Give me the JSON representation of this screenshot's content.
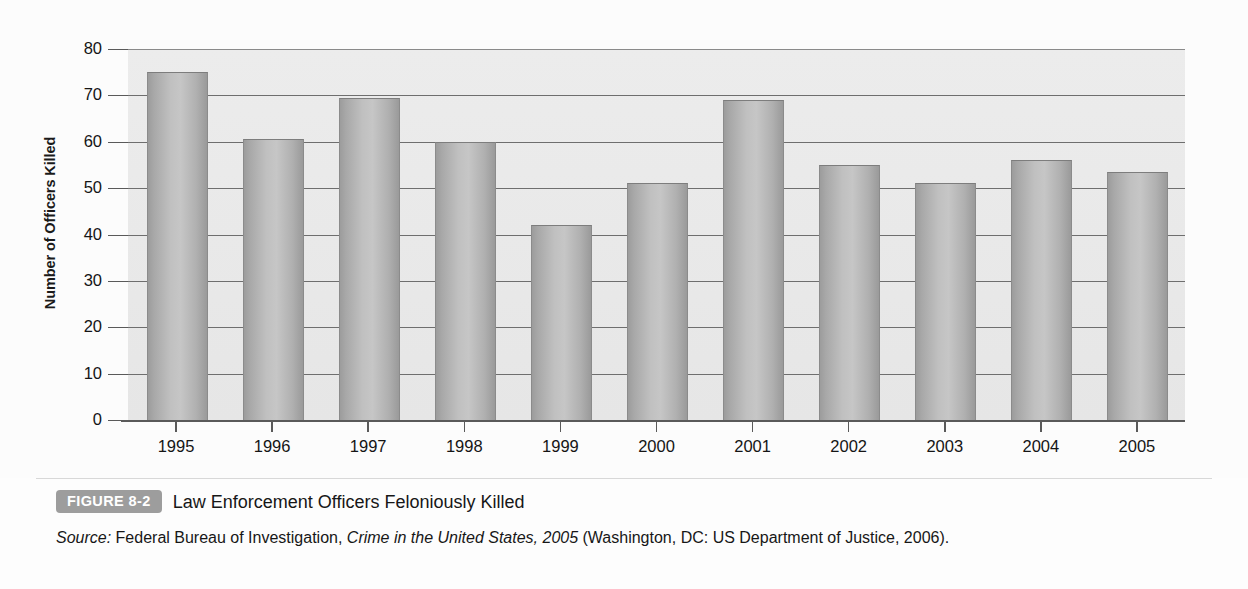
{
  "figure": {
    "badge_label": "FIGURE 8-2",
    "title": "Law Enforcement Officers Feloniously Killed",
    "source_prefix": "Source:",
    "source_agency": " Federal Bureau of Investigation, ",
    "source_publication": "Crime in the United States, 2005",
    "source_suffix": " (Washington, DC: US Department of Justice, 2006)."
  },
  "colors": {
    "plot_background": "#e9e9e9",
    "bar_fill": "#bcbcbc",
    "bar_edge": "#8b8b8b",
    "gridline": "#6e6e6e",
    "axis": "#5a5a5a",
    "badge": "#9d9d9d",
    "text": "#151515"
  },
  "chart_data": {
    "type": "bar",
    "title": "Law Enforcement Officers Feloniously Killed",
    "xlabel": "",
    "ylabel": "Number of Officers Killed",
    "categories": [
      "1995",
      "1996",
      "1997",
      "1998",
      "1999",
      "2000",
      "2001",
      "2002",
      "2003",
      "2004",
      "2005"
    ],
    "values": [
      75,
      60.5,
      69.5,
      60,
      42,
      51,
      69,
      55,
      51,
      56,
      53.5
    ],
    "ylim": [
      0,
      80
    ],
    "yticks": [
      0,
      10,
      20,
      30,
      40,
      50,
      60,
      70,
      80
    ],
    "ytick_labels": [
      "0",
      "10",
      "20",
      "30",
      "40",
      "50",
      "60",
      "70",
      "80"
    ],
    "grid": true,
    "legend": "none"
  }
}
